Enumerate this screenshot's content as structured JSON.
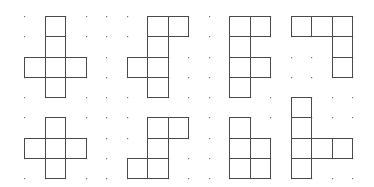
{
  "diagram": {
    "type": "polyomino-nets-on-dot-grid",
    "grid": {
      "origin_x": 24,
      "origin_y": 16,
      "spacing_x": 20.5,
      "spacing_y": 20.25,
      "columns": 17,
      "rows": 9,
      "dot_color": "#7a7a7a"
    },
    "line_color": "#4a4a4a",
    "figures": [
      {
        "name": "figure-top-1",
        "cells": [
          [
            1,
            0
          ],
          [
            1,
            1
          ],
          [
            0,
            2
          ],
          [
            1,
            2
          ],
          [
            2,
            2
          ],
          [
            1,
            3
          ]
        ]
      },
      {
        "name": "figure-top-2",
        "cells": [
          [
            6,
            0
          ],
          [
            7,
            0
          ],
          [
            6,
            1
          ],
          [
            5,
            2
          ],
          [
            6,
            2
          ],
          [
            6,
            3
          ]
        ]
      },
      {
        "name": "figure-top-3",
        "cells": [
          [
            10,
            0
          ],
          [
            11,
            0
          ],
          [
            10,
            1
          ],
          [
            10,
            2
          ],
          [
            11,
            2
          ],
          [
            10,
            3
          ]
        ]
      },
      {
        "name": "figure-top-4",
        "cells": [
          [
            13,
            0
          ],
          [
            14,
            0
          ],
          [
            15,
            0
          ],
          [
            15,
            1
          ],
          [
            15,
            2
          ]
        ]
      },
      {
        "name": "figure-bottom-1",
        "cells": [
          [
            1,
            5
          ],
          [
            0,
            6
          ],
          [
            1,
            6
          ],
          [
            2,
            6
          ],
          [
            1,
            7
          ]
        ]
      },
      {
        "name": "figure-bottom-2",
        "cells": [
          [
            6,
            5
          ],
          [
            7,
            5
          ],
          [
            6,
            6
          ],
          [
            5,
            7
          ],
          [
            6,
            7
          ]
        ]
      },
      {
        "name": "figure-bottom-3",
        "cells": [
          [
            10,
            5
          ],
          [
            10,
            6
          ],
          [
            11,
            6
          ],
          [
            10,
            7
          ],
          [
            11,
            7
          ]
        ]
      },
      {
        "name": "figure-bottom-4",
        "cells": [
          [
            13,
            4
          ],
          [
            13,
            5
          ],
          [
            13,
            6
          ],
          [
            14,
            6
          ],
          [
            15,
            6
          ],
          [
            13,
            7
          ]
        ]
      }
    ]
  }
}
